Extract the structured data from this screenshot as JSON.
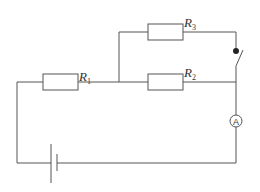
{
  "diagram": {
    "type": "circuit",
    "components": {
      "R1": {
        "label": "R",
        "subscript": "1"
      },
      "R2": {
        "label": "R",
        "subscript": "2"
      },
      "R3": {
        "label": "R",
        "subscript": "3"
      },
      "ammeter": {
        "label": "A"
      },
      "switch": {
        "state": "open"
      },
      "battery": {
        "cells": 1
      }
    },
    "colors": {
      "wire": "#555555",
      "background": "#ffffff"
    }
  }
}
